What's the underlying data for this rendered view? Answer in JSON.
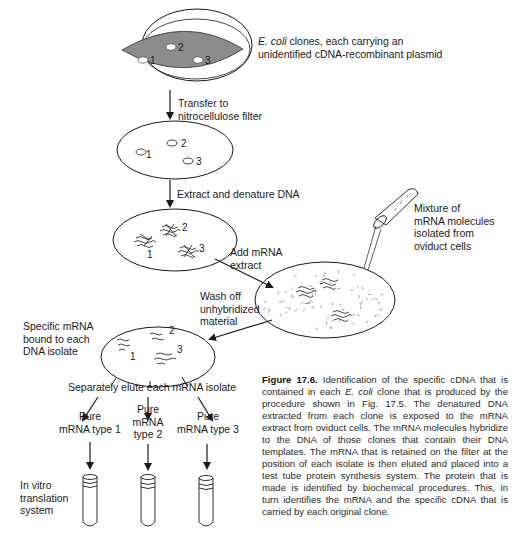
{
  "labels": {
    "clones_italic": "E. coli",
    "clones_rest": " clones, each carrying an",
    "clones_line2": "unidentified cDNA-recombinant plasmid",
    "transfer_line1": "Transfer to",
    "transfer_line2": "nitrocellulose filter",
    "extract": "Extract and denature DNA",
    "add_mrna_line1": "Add mRNA",
    "add_mrna_line2": "extract",
    "mixture_line1": "Mixture of",
    "mixture_line2": "mRNA molecules",
    "mixture_line3": "isolated from",
    "mixture_line4": "oviduct cells",
    "wash_line1": "Wash off",
    "wash_line2": "unhybridized",
    "wash_line3": "material",
    "specific_line1": "Specific mRNA",
    "specific_line2": "bound to each",
    "specific_line3": "DNA isolate",
    "elute": "Separately elute each mRNA isolate",
    "pure1_line1": "Pure",
    "pure1_line2": "mRNA type 1",
    "pure2_line1": "Pure",
    "pure2_line2": "mRNA",
    "pure2_line3": "type 2",
    "pure3_line1": "Pure",
    "pure3_line2": "mRNA type 3",
    "invitro_line1": "In vitro",
    "invitro_line2": "translation",
    "invitro_line3": "system"
  },
  "clone_numbers": [
    "1",
    "2",
    "3"
  ],
  "caption": {
    "figure_label": "Figure 17.6.",
    "part1": " Identification of the specific cDNA that is contained in each ",
    "italic": "E. coli",
    "part2": " clone that is produced by the procedure shown in Fig. 17.5. The denatured DNA extracted from each clone is exposed to the mRNA extract from oviduct cells. The mRNA molecules hybridize to the DNA of those clones that contain their DNA templates. The mRNA that is retained on the filter at the position of each isolate is then eluted and placed into a test tube protein synthesis system. The protein that is made is identified by biochemical procedures. This, in turn identifies the mRNA and the specific cDNA that is carried by each original clone."
  },
  "colors": {
    "agar": "#8c8c8c",
    "ink": "#1a1a1a"
  }
}
